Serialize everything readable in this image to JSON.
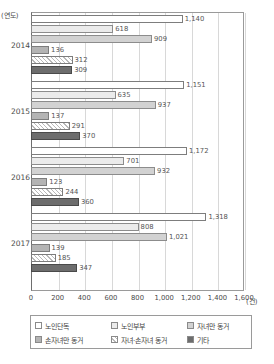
{
  "chart_data": {
    "type": "bar",
    "orientation": "horizontal",
    "title": "",
    "xlabel": "(건)",
    "ylabel": "(연도)",
    "xlim": [
      0,
      1600
    ],
    "xticks": [
      "0",
      "200",
      "400",
      "600",
      "800",
      "1,000",
      "1,200",
      "1,400",
      "1,600"
    ],
    "xtick_values": [
      0,
      200,
      400,
      600,
      800,
      1000,
      1200,
      1400,
      1600
    ],
    "grid": true,
    "legend_position": "bottom",
    "categories": [
      "2014",
      "2015",
      "2016",
      "2017"
    ],
    "series": [
      {
        "name": "노인단독",
        "values": [
          1140,
          1151,
          1172,
          1318
        ]
      },
      {
        "name": "노인부부",
        "values": [
          618,
          635,
          701,
          808
        ]
      },
      {
        "name": "자녀만 동거",
        "values": [
          909,
          937,
          932,
          1021
        ]
      },
      {
        "name": "손자녀만 동거",
        "values": [
          136,
          137,
          123,
          139
        ]
      },
      {
        "name": "자녀·손자녀 동거",
        "values": [
          312,
          291,
          244,
          185
        ]
      },
      {
        "name": "기타",
        "values": [
          309,
          370,
          360,
          347
        ]
      }
    ],
    "value_labels": [
      [
        "1,140",
        "618",
        "909",
        "136",
        "312",
        "309"
      ],
      [
        "1,151",
        "635",
        "937",
        "137",
        "291",
        "370"
      ],
      [
        "1,172",
        "701",
        "932",
        "123",
        "244",
        "360"
      ],
      [
        "1,318",
        "808",
        "1,021",
        "139",
        "185",
        "347"
      ]
    ]
  },
  "legend": {
    "items": [
      {
        "label": "노인단독",
        "swatch": "s0"
      },
      {
        "label": "노인부부",
        "swatch": "s1"
      },
      {
        "label": "자녀만 동거",
        "swatch": "s2"
      },
      {
        "label": "손자녀만 동거",
        "swatch": "s3"
      },
      {
        "label": "자녀·손자녀 동거",
        "swatch": "s4"
      },
      {
        "label": "기타",
        "swatch": "s5"
      }
    ]
  },
  "colors": {
    "series": [
      "#ffffff",
      "#ebebeb",
      "#d2d2d2",
      "#b4b4b4",
      "#ffffff",
      "#6d6d6d"
    ],
    "frame": "#9a9a9a",
    "grid": "#d8d8d8",
    "text": "#4a4a4a"
  }
}
